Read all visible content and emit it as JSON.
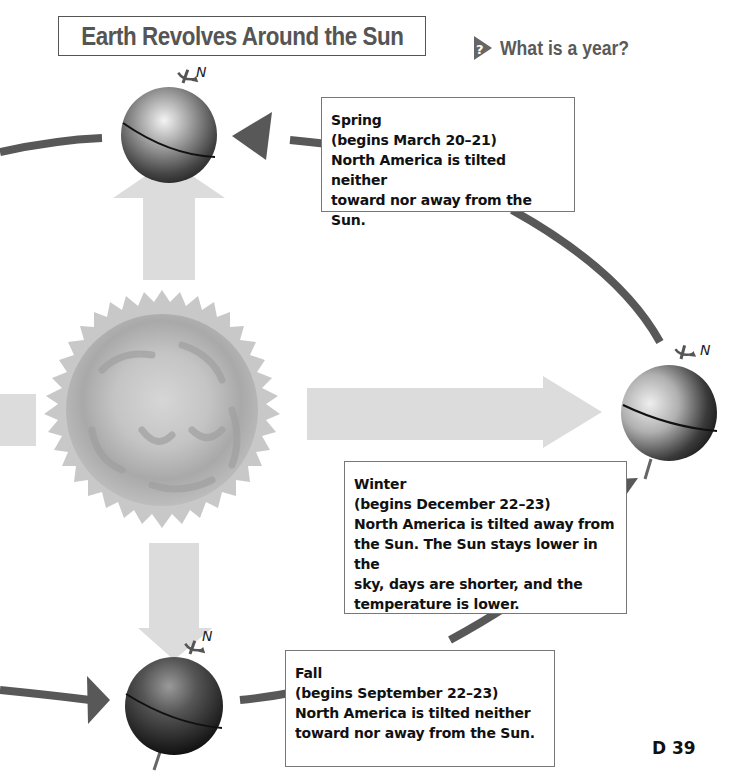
{
  "title": "Earth Revolves Around the Sun",
  "question": {
    "icon": "question-arrow-icon",
    "text": "What is a year?"
  },
  "earth_positions": [
    {
      "id": "spring",
      "north_label": "N",
      "position": "top"
    },
    {
      "id": "winter",
      "north_label": "N",
      "position": "right"
    },
    {
      "id": "fall",
      "north_label": "N",
      "position": "bottom"
    }
  ],
  "info_boxes": {
    "spring": {
      "season": "Spring",
      "dates": "(begins March 20–21)",
      "lines": [
        "North America is tilted neither",
        "toward nor away from the Sun."
      ]
    },
    "winter": {
      "season": "Winter",
      "dates": "(begins December 22–23)",
      "lines": [
        "North America is tilted away from",
        "the Sun. The Sun stays lower in the",
        "sky, days are shorter, and the",
        "temperature is lower."
      ]
    },
    "fall": {
      "season": "Fall",
      "dates": "(begins September 22–23)",
      "lines": [
        "North America is tilted neither",
        "toward nor away from the Sun."
      ]
    }
  },
  "page_number": "D 39",
  "colors": {
    "orbit": "#555555",
    "sunlight_arrow": "#dcdcdc",
    "sun": "#b8b8b8",
    "title_text": "#555555"
  }
}
